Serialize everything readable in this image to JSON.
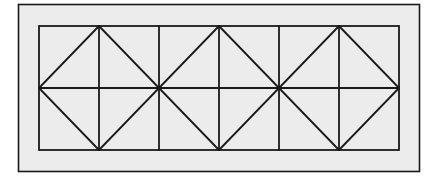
{
  "diagram": {
    "colors": {
      "background": "#ffffff",
      "panel_fill": "#ececec",
      "stroke": "#1a1a1a"
    },
    "outer_rect": {
      "x": 18,
      "y": 4,
      "w": 401,
      "h": 167
    },
    "inner_rect": {
      "x": 39,
      "y": 26,
      "w": 360,
      "h": 124
    },
    "columns": 6,
    "rows": 2,
    "diamonds": 3
  }
}
